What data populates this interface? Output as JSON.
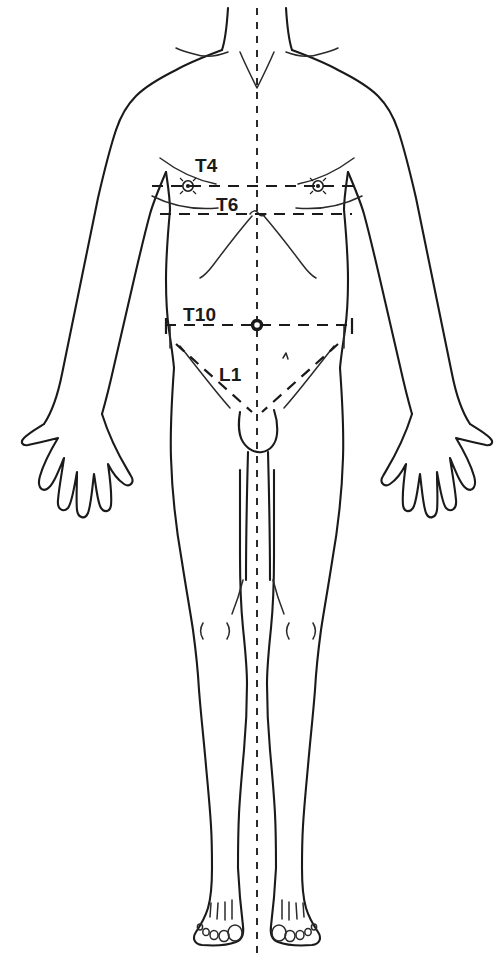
{
  "diagram": {
    "view": "anterior",
    "background_color": "#ffffff",
    "line_color": "#1a1a1a",
    "canvas": {
      "width": 504,
      "height": 963
    }
  },
  "midline": {
    "name": "body-midline",
    "style": "dashed",
    "x": 257,
    "y_start": 8,
    "y_end": 955
  },
  "labels": {
    "t4": "T4",
    "t6": "T6",
    "t10": "T10",
    "l1": "L1"
  },
  "landmarks": [
    {
      "label": "T4",
      "landmark": "nipple line",
      "line_y": 186,
      "line_x_start": 152,
      "line_x_end": 360,
      "marker": "nipple",
      "marker_x": [
        188,
        318
      ]
    },
    {
      "label": "T6",
      "landmark": "xiphoid process",
      "line_y": 214,
      "line_x_start": 160,
      "line_x_end": 352,
      "marker": "xiphisternum",
      "marker_x": [
        257
      ]
    },
    {
      "label": "T10",
      "landmark": "umbilicus",
      "line_y": 325,
      "line_x_start": 165,
      "line_x_end": 355,
      "marker": "umbilicus",
      "marker_x": [
        257
      ]
    },
    {
      "label": "L1",
      "landmark": "inguinal ligament",
      "line_y": 0,
      "line_x_start": 0,
      "line_x_end": 0,
      "marker": "inguinal-crease",
      "marker_x": []
    }
  ],
  "body_parts": [
    "neck",
    "clavicles",
    "shoulders",
    "arms",
    "hands",
    "chest",
    "abdomen",
    "costal-margin",
    "groin",
    "thighs",
    "knees",
    "lower-legs",
    "feet",
    "toes"
  ]
}
